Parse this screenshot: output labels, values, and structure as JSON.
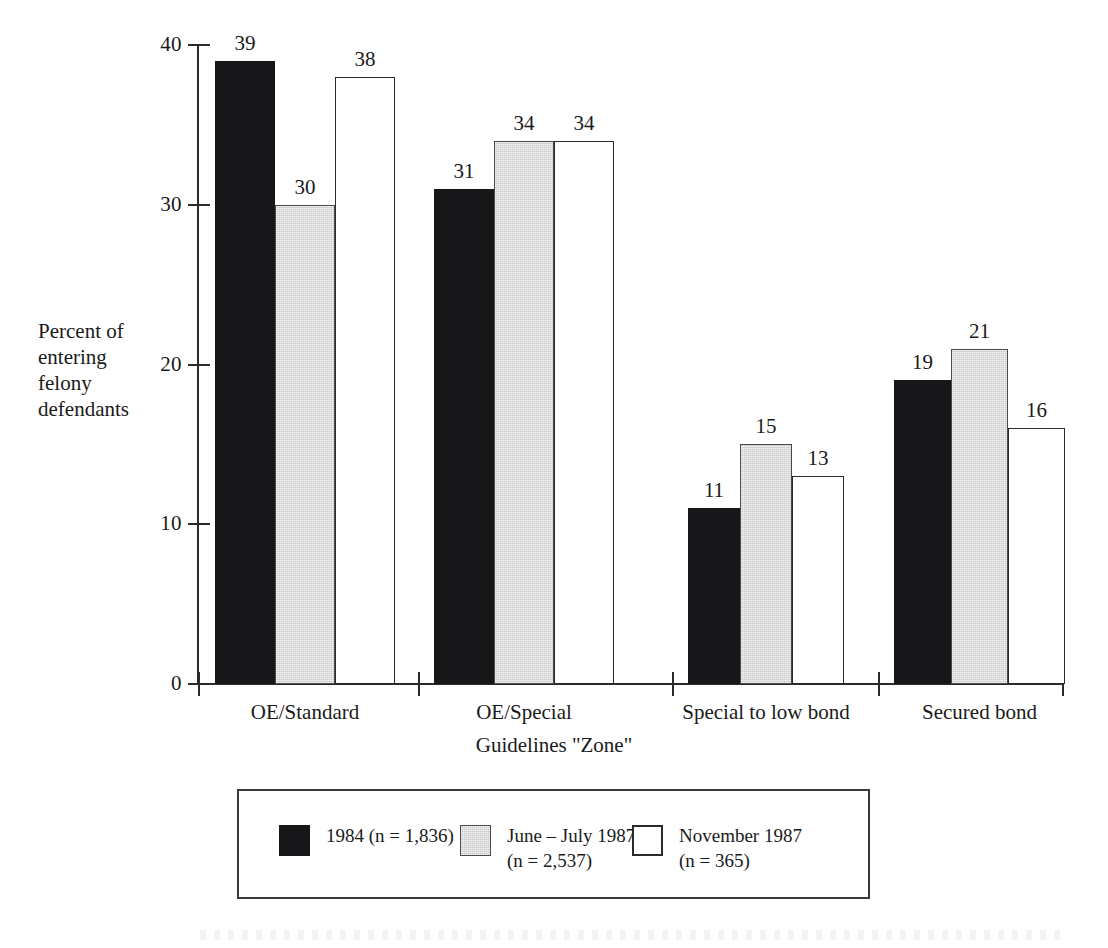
{
  "chart_data": {
    "type": "bar",
    "title": "",
    "xlabel": "Guidelines \"Zone\"",
    "ylabel": "Percent of entering felony defendants",
    "categories": [
      "OE/Standard",
      "OE/Special",
      "Special to low bond",
      "Secured bond"
    ],
    "series": [
      {
        "name": "1984 (n = 1,836)",
        "color": "#17171a",
        "values": [
          39,
          31,
          11,
          19
        ]
      },
      {
        "name": "June – July 1987\n(n = 2,537)",
        "color": "#c9c9c9",
        "values": [
          30,
          34,
          15,
          21
        ]
      },
      {
        "name": "November 1987\n(n = 365)",
        "color": "#ffffff",
        "values": [
          38,
          34,
          13,
          16
        ]
      }
    ],
    "ylim": [
      0,
      40
    ],
    "yticks": [
      0,
      10,
      20,
      30,
      40
    ],
    "ytick_labels": [
      "0",
      "10",
      "20",
      "30",
      "40"
    ],
    "grid": false,
    "legend_position": "bottom"
  },
  "axes": {
    "y_title": "Percent of\nentering\nfelony\ndefendants",
    "x_title": "Guidelines \"Zone\"",
    "y_ticks": [
      "40",
      "30",
      "20",
      "10",
      "0"
    ]
  },
  "legend": {
    "entries": [
      {
        "label": "1984 (n = 1,836)",
        "swatch": "black-swatch"
      },
      {
        "label": "June – July 1987\n(n = 2,537)",
        "swatch": "gray-swatch"
      },
      {
        "label": "November 1987\n(n = 365)",
        "swatch": "white-swatch"
      }
    ]
  },
  "values": {
    "g0": [
      "39",
      "30",
      "38"
    ],
    "g1": [
      "31",
      "34",
      "34"
    ],
    "g2": [
      "11",
      "15",
      "13"
    ],
    "g3": [
      "19",
      "21",
      "16"
    ]
  },
  "categories": {
    "c0": "OE/Standard",
    "c1": "OE/Special",
    "c2": "Special to low bond",
    "c3": "Secured bond"
  }
}
